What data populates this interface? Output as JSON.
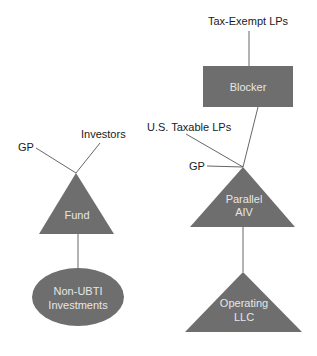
{
  "diagram": {
    "colors": {
      "shape_fill": "#6e6e6e",
      "shape_text": "#e6e6e6",
      "label_text": "#1a1a1a",
      "edge": "#555555",
      "background": "#ffffff"
    },
    "left_structure": {
      "labels": {
        "gp": "GP",
        "investors": "Investors"
      },
      "fund": {
        "shape": "triangle",
        "line1": "Fund"
      },
      "investments": {
        "shape": "ellipse",
        "line1": "Non-UBTI",
        "line2": "Investments"
      }
    },
    "right_structure": {
      "labels": {
        "tax_exempt": "Tax-Exempt LPs",
        "us_taxable": "U.S. Taxable LPs",
        "gp": "GP"
      },
      "blocker": {
        "shape": "rectangle",
        "line1": "Blocker"
      },
      "parallel_aiv": {
        "shape": "triangle",
        "line1": "Parallel",
        "line2": "AIV"
      },
      "operating_llc": {
        "shape": "triangle",
        "line1": "Operating",
        "line2": "LLC"
      }
    }
  }
}
